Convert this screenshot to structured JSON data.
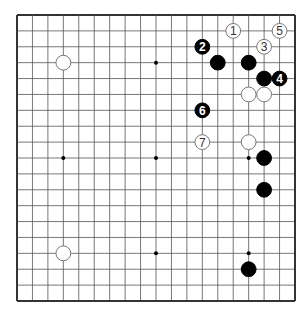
{
  "diagram": {
    "type": "go-board",
    "size": 19,
    "colors": {
      "background": "#ffffff",
      "line": "#555555",
      "border": "#333333",
      "black": "#000000",
      "white": "#ffffff"
    },
    "hoshi": [
      [
        3,
        3
      ],
      [
        9,
        3
      ],
      [
        15,
        3
      ],
      [
        3,
        9
      ],
      [
        9,
        9
      ],
      [
        15,
        9
      ],
      [
        3,
        15
      ],
      [
        9,
        15
      ],
      [
        15,
        15
      ]
    ],
    "stones": [
      {
        "color": "white",
        "col": 3,
        "row": 3,
        "label": ""
      },
      {
        "color": "white",
        "col": 3,
        "row": 15,
        "label": ""
      },
      {
        "color": "white",
        "col": 14,
        "row": 1,
        "label": "1"
      },
      {
        "color": "black",
        "col": 12,
        "row": 2,
        "label": "2"
      },
      {
        "color": "white",
        "col": 16,
        "row": 2,
        "label": "3"
      },
      {
        "color": "black",
        "col": 17,
        "row": 4,
        "label": "4"
      },
      {
        "color": "white",
        "col": 17,
        "row": 1,
        "label": "5"
      },
      {
        "color": "black",
        "col": 12,
        "row": 6,
        "label": "6"
      },
      {
        "color": "white",
        "col": 12,
        "row": 8,
        "label": "7"
      },
      {
        "color": "black",
        "col": 13,
        "row": 3,
        "label": ""
      },
      {
        "color": "black",
        "col": 15,
        "row": 3,
        "label": ""
      },
      {
        "color": "black",
        "col": 16,
        "row": 4,
        "label": ""
      },
      {
        "color": "white",
        "col": 15,
        "row": 5,
        "label": ""
      },
      {
        "color": "white",
        "col": 16,
        "row": 5,
        "label": ""
      },
      {
        "color": "white",
        "col": 15,
        "row": 8,
        "label": ""
      },
      {
        "color": "black",
        "col": 16,
        "row": 9,
        "label": ""
      },
      {
        "color": "black",
        "col": 16,
        "row": 11,
        "label": ""
      },
      {
        "color": "black",
        "col": 15,
        "row": 16,
        "label": ""
      }
    ]
  }
}
